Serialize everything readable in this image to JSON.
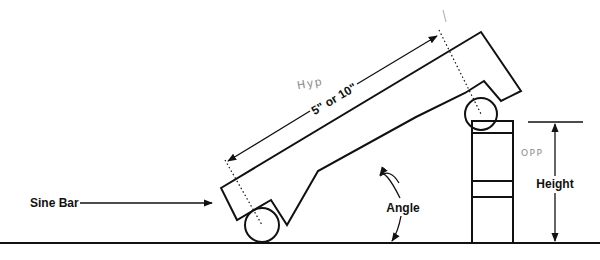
{
  "diagram": {
    "labels": {
      "sine_bar": "Sine Bar",
      "length": "5\" or 10\"",
      "hyp": "Hyp",
      "opp": "OPP",
      "angle": "Angle",
      "height": "Height"
    },
    "colors": {
      "line": "#111111",
      "handwriting": "#8a8a8a",
      "background": "#ffffff"
    }
  }
}
